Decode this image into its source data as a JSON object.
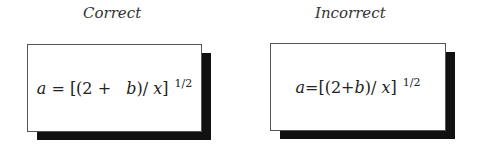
{
  "panels": [
    {
      "title": "Correct",
      "equation": {
        "var_a": "a",
        "eq_part": " = [(2 +   ",
        "var_b": "b",
        "mid": ")/ ",
        "var_x": "x",
        "close": "]",
        "exponent": "1/2"
      }
    },
    {
      "title": "Incorrect",
      "equation": {
        "var_a": "a",
        "eq_part": "=[(2+",
        "var_b": "b",
        "mid": ")/ ",
        "var_x": "x",
        "close": "]",
        "exponent": "1/2"
      }
    }
  ]
}
